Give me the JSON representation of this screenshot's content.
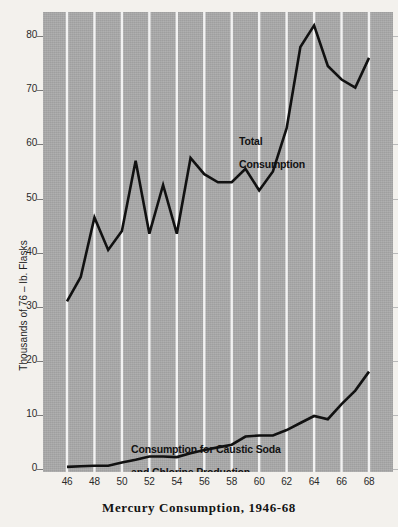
{
  "chart_data": {
    "type": "line",
    "title": "Mercury Consumption, 1946-68",
    "xlabel": "",
    "ylabel": "Thousands of 76 – lb. Flasks",
    "xlim": [
      1946,
      1968
    ],
    "ylim": [
      0,
      83
    ],
    "grid": "vertical white gridlines every 2 years",
    "legend_position": "in-plot annotations",
    "background_color": "#a9a9a9",
    "line_color": "#111111",
    "gridline_color": "#f2f2f2",
    "x": [
      1946,
      1947,
      1948,
      1949,
      1950,
      1951,
      1952,
      1953,
      1954,
      1955,
      1956,
      1957,
      1958,
      1959,
      1960,
      1961,
      1962,
      1963,
      1964,
      1965,
      1966,
      1967,
      1968
    ],
    "xtick_labels": [
      "46",
      "48",
      "50",
      "52",
      "54",
      "56",
      "58",
      "60",
      "62",
      "64",
      "66",
      "68"
    ],
    "xtick_values": [
      1946,
      1948,
      1950,
      1952,
      1954,
      1956,
      1958,
      1960,
      1962,
      1964,
      1966,
      1968
    ],
    "ytick_labels": [
      "0",
      "10",
      "20",
      "30",
      "40",
      "50",
      "60",
      "70",
      "80"
    ],
    "ytick_values": [
      0,
      10,
      20,
      30,
      40,
      50,
      60,
      70,
      80
    ],
    "series": [
      {
        "name": "Total Consumption",
        "label_lines": [
          "Total",
          "Consumption"
        ],
        "values": [
          31,
          35.5,
          46.5,
          40.5,
          44,
          57,
          43.5,
          52.5,
          43.5,
          57.5,
          54.5,
          53,
          53,
          55.5,
          51.5,
          55,
          63,
          78,
          82,
          74.5,
          72,
          70.5,
          76
        ]
      },
      {
        "name": "Consumption for Caustic Soda and Chlorine Production",
        "label_lines": [
          "Consumption for Caustic Soda",
          "and Chlorine Production"
        ],
        "values": [
          0.4,
          0.5,
          0.6,
          0.6,
          1.2,
          1.7,
          2.3,
          2.3,
          2.2,
          2.9,
          3.5,
          4.0,
          4.5,
          6.0,
          6.2,
          6.2,
          7.2,
          8.5,
          9.8,
          9.2,
          12.0,
          14.5,
          18.0
        ]
      }
    ]
  },
  "axes": {
    "y_title": "Thousands of 76 – lb. Flasks"
  },
  "title": {
    "text": "Mercury Consumption, 1946-68"
  }
}
